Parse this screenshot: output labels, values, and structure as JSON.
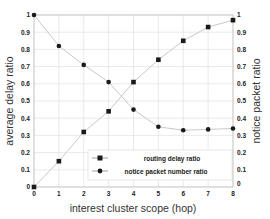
{
  "chart_data": {
    "type": "line",
    "title": "",
    "xlabel": "interest cluster scope (hop)",
    "ylabel_left": "average delay ratio",
    "ylabel_right": "notice packet ratio",
    "x": [
      0,
      1,
      2,
      3,
      4,
      5,
      6,
      7,
      8
    ],
    "xlim": [
      0,
      8
    ],
    "ylim": [
      0,
      1
    ],
    "x_ticks": [
      "0",
      "1",
      "2",
      "3",
      "4",
      "5",
      "6",
      "7",
      "8"
    ],
    "y_ticks_left": [
      "0",
      "0.1",
      "0.2",
      "0.3",
      "0.4",
      "0.5",
      "0.6",
      "0.7",
      "0.8",
      "0.9",
      "1"
    ],
    "y_ticks_right": [
      "0",
      "0.1",
      "0.2",
      "0.3",
      "0.4",
      "0.5",
      "0.6",
      "0.7",
      "0.8",
      "0.9",
      "1"
    ],
    "grid": true,
    "legend_position": "lower right",
    "series": [
      {
        "name": "routing delay ratio",
        "marker": "square",
        "axis": "left",
        "values": [
          0.0,
          0.15,
          0.32,
          0.44,
          0.61,
          0.74,
          0.85,
          0.93,
          0.97
        ]
      },
      {
        "name": "notice packet number ratio",
        "marker": "circle",
        "axis": "right",
        "values": [
          1.0,
          0.82,
          0.71,
          0.61,
          0.45,
          0.35,
          0.33,
          0.335,
          0.34
        ]
      }
    ],
    "colors": {
      "line": "#c8c8c8",
      "marker": "#1a1a1a",
      "grid": "#dcdcdc",
      "frame": "#c0c0c0"
    }
  },
  "legend": {
    "items": [
      {
        "label": "routing delay ratio",
        "marker": "square"
      },
      {
        "label": "notice packet number ratio",
        "marker": "circle"
      }
    ]
  }
}
